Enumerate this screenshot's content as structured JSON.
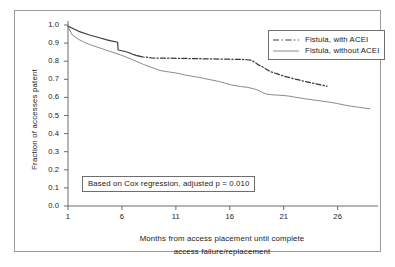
{
  "chart_data": {
    "type": "line",
    "title": "",
    "xlabel_lines": [
      "Months from access placement until complete",
      "access failure/replacement"
    ],
    "ylabel": "Fraction of accesses patent",
    "xlim": [
      1,
      29
    ],
    "ylim": [
      0.0,
      1.0
    ],
    "grid": false,
    "legend_position": "top-right",
    "xticks": [
      "1",
      "6",
      "11",
      "16",
      "21",
      "26"
    ],
    "xtick_values": [
      1,
      6,
      11,
      16,
      21,
      26
    ],
    "yticks": [
      "0.0",
      "0.1",
      "0.2",
      "0.3",
      "0.4",
      "0.5",
      "0.6",
      "0.7",
      "0.8",
      "0.9",
      "1.0"
    ],
    "ytick_values": [
      0.0,
      0.1,
      0.2,
      0.3,
      0.4,
      0.5,
      0.6,
      0.7,
      0.8,
      0.9,
      1.0
    ],
    "annotation": "Based on Cox regression, adjusted p = 0.010",
    "series": [
      {
        "name": "Fistula, with ACEI",
        "style": "dash-dot",
        "color": "#3a3a3a",
        "x": [
          1.0,
          1.3,
          2.0,
          3.0,
          4.0,
          4.6,
          5.0,
          5.6,
          5.65,
          6.2,
          6.6,
          7.0,
          7.3,
          7.6,
          7.9,
          8.3,
          8.7,
          9.2,
          10.0,
          11.0,
          12.0,
          13.0,
          14.0,
          15.0,
          16.0,
          17.0,
          17.6,
          18.0,
          18.4,
          18.7,
          19.0,
          19.4,
          19.8,
          20.4,
          21.0,
          22.0,
          23.0,
          24.0,
          25.0
        ],
        "y": [
          0.995,
          0.985,
          0.965,
          0.945,
          0.928,
          0.918,
          0.912,
          0.905,
          0.862,
          0.855,
          0.848,
          0.838,
          0.832,
          0.828,
          0.824,
          0.822,
          0.818,
          0.817,
          0.817,
          0.816,
          0.815,
          0.814,
          0.813,
          0.812,
          0.811,
          0.81,
          0.808,
          0.806,
          0.79,
          0.778,
          0.77,
          0.755,
          0.742,
          0.73,
          0.718,
          0.702,
          0.688,
          0.675,
          0.662
        ]
      },
      {
        "name": "Fistula, without ACEI",
        "style": "solid",
        "color": "#7d7d7d",
        "x": [
          1.0,
          1.4,
          2.0,
          2.6,
          3.2,
          4.0,
          5.0,
          6.0,
          7.0,
          8.0,
          9.0,
          9.6,
          10.2,
          11.0,
          12.0,
          13.0,
          14.0,
          15.0,
          15.6,
          16.2,
          17.0,
          17.6,
          18.2,
          18.6,
          19.0,
          19.4,
          20.0,
          20.6,
          21.4,
          22.0,
          23.0,
          24.0,
          25.0,
          26.0,
          26.6,
          27.2,
          28.0,
          29.0
        ],
        "y": [
          0.99,
          0.945,
          0.92,
          0.902,
          0.888,
          0.872,
          0.852,
          0.832,
          0.808,
          0.782,
          0.76,
          0.748,
          0.742,
          0.735,
          0.722,
          0.712,
          0.7,
          0.688,
          0.678,
          0.668,
          0.66,
          0.656,
          0.648,
          0.64,
          0.628,
          0.618,
          0.614,
          0.612,
          0.608,
          0.602,
          0.592,
          0.584,
          0.576,
          0.566,
          0.558,
          0.552,
          0.545,
          0.537
        ]
      }
    ]
  },
  "legend": {
    "items": [
      {
        "label": "Fistula, with ACEI"
      },
      {
        "label": "Fistula, without ACEI"
      }
    ]
  },
  "axes": {
    "y_title": "Fraction of accesses patent",
    "x_title_line1": "Months from access placement until complete",
    "x_title_line2": "access failure/replacement"
  },
  "annotation": {
    "text": "Based on Cox regression, adjusted p = 0.010"
  }
}
